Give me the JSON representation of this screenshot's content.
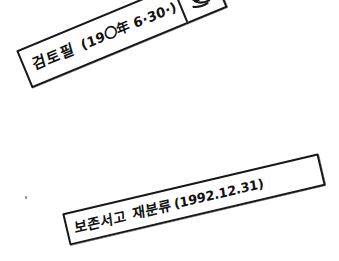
{
  "document": {
    "kind": "scanned-document-fragment",
    "background_color": "#ffffff",
    "ink_color": "#17171a"
  },
  "stamps": [
    {
      "id": "review-stamp",
      "name": "검토필",
      "label": "검토필",
      "date": "(19〇年 6·30·)",
      "has_seal": true,
      "seal_description": "handwritten-initial-seal",
      "rotation_deg": -22.5
    },
    {
      "id": "reclassification-stamp",
      "name": "보존서고 재분류",
      "label": "보존서고 재분류",
      "date": "(1992.12.31)",
      "has_seal": false,
      "rotation_deg": -13.2
    }
  ],
  "artifacts": {
    "speck_label": "scanner-speck"
  }
}
